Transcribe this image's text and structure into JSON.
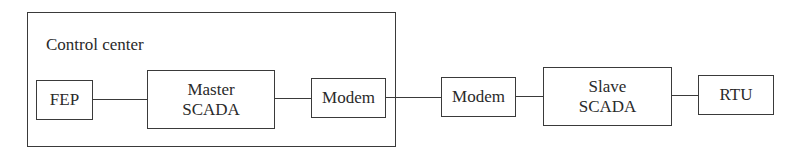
{
  "diagram": {
    "control_center": {
      "label": "Control center"
    },
    "nodes": [
      {
        "id": "fep",
        "label": "FEP"
      },
      {
        "id": "master_scada",
        "line1": "Master",
        "line2": "SCADA"
      },
      {
        "id": "modem_cc",
        "label": "Modem"
      },
      {
        "id": "modem_remote",
        "label": "Modem"
      },
      {
        "id": "slave_scada",
        "line1": "Slave",
        "line2": "SCADA"
      },
      {
        "id": "rtu",
        "label": "RTU"
      }
    ],
    "edges": [
      [
        "fep",
        "master_scada"
      ],
      [
        "master_scada",
        "modem_cc"
      ],
      [
        "modem_cc",
        "modem_remote"
      ],
      [
        "modem_remote",
        "slave_scada"
      ],
      [
        "slave_scada",
        "rtu"
      ]
    ],
    "colors": {
      "stroke": "#3a3a3a",
      "text": "#2a2a2a",
      "background": "#ffffff"
    }
  }
}
